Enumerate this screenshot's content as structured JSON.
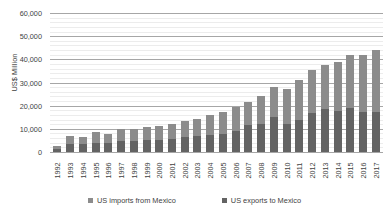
{
  "chart_data": {
    "type": "bar",
    "stacked": true,
    "title": "",
    "xlabel": "",
    "ylabel": "US$ Million",
    "ylim": [
      0,
      60000
    ],
    "ytick_step": 10000,
    "minor_gridline_step": 2000,
    "grid": true,
    "legend_position": "bottom",
    "categories": [
      "1992",
      "1993",
      "1994",
      "1995",
      "1996",
      "1997",
      "1998",
      "1999",
      "2000",
      "2001",
      "2002",
      "2003",
      "2004",
      "2005",
      "2006",
      "2007",
      "2008",
      "2009",
      "2010",
      "2011",
      "2012",
      "2013",
      "2014",
      "2015",
      "2016",
      "2017"
    ],
    "ytick_labels": [
      "0",
      "10,000",
      "20,000",
      "30,000",
      "40,000",
      "50,000",
      "60,000"
    ],
    "ytick_values": [
      0,
      10000,
      20000,
      30000,
      40000,
      50000,
      60000
    ],
    "series": [
      {
        "name": "US exports to Mexico",
        "color": "#636363",
        "values": [
          1400,
          3400,
          3500,
          3900,
          3800,
          4800,
          4600,
          5100,
          5400,
          5700,
          6400,
          7100,
          7300,
          7900,
          9100,
          11600,
          12000,
          15300,
          12300,
          13900,
          16900,
          18500,
          17800,
          19100,
          17200,
          17300
        ]
      },
      {
        "name": "US imports from Mexico",
        "color": "#8c8c8c",
        "values": [
          1000,
          3300,
          3200,
          4900,
          3800,
          5200,
          5300,
          5800,
          5800,
          6400,
          6800,
          7200,
          8700,
          9500,
          10400,
          10000,
          12000,
          12600,
          14700,
          17100,
          18300,
          19200,
          21100,
          22700,
          24800,
          26700
        ]
      }
    ],
    "totals": [
      2400,
      6700,
      6700,
      8800,
      7600,
      10000,
      9900,
      10900,
      11200,
      12100,
      13200,
      14300,
      16000,
      17400,
      19500,
      21600,
      24000,
      27900,
      27000,
      31000,
      35200,
      37700,
      38900,
      41800,
      42000,
      44000
    ]
  },
  "legend": {
    "items": [
      {
        "label": "US imports from Mexico",
        "swatch": "imports"
      },
      {
        "label": "US exports to Mexico",
        "swatch": "exports"
      }
    ]
  }
}
